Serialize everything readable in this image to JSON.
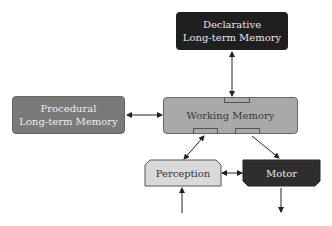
{
  "nodes": {
    "declarative": {
      "line1": "Declarative",
      "line2": "Long-term Memory",
      "fill": "#1f1f1f",
      "text": "#e6e6e6"
    },
    "procedural": {
      "line1": "Procedural",
      "line2": "Long-term Memory",
      "fill": "#7a7a7a",
      "text": "#eeeeee"
    },
    "working": {
      "label": "Working Memory",
      "fill": "#a9a9a9",
      "text": "#3a3a3a"
    },
    "perception": {
      "label": "Perception",
      "fill": "#d9d9d9",
      "text": "#333333"
    },
    "motor": {
      "label": "Motor",
      "fill": "#2e2e2e",
      "text": "#e8e8e8"
    }
  },
  "edges": [
    {
      "from": "declarative",
      "to": "working",
      "bidirectional": true
    },
    {
      "from": "procedural",
      "to": "working",
      "bidirectional": true
    },
    {
      "from": "working",
      "to": "perception",
      "bidirectional": true
    },
    {
      "from": "working",
      "to": "motor",
      "bidirectional": false
    },
    {
      "from": "perception",
      "to": "motor",
      "bidirectional": true
    },
    {
      "from": "input",
      "to": "perception",
      "bidirectional": false
    },
    {
      "from": "motor",
      "to": "output",
      "bidirectional": false
    }
  ]
}
